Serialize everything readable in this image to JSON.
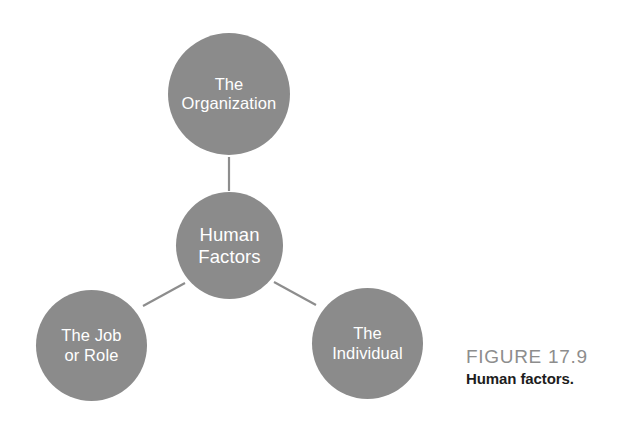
{
  "figure": {
    "caption_number": "FIGURE 17.9",
    "caption_title": "Human factors.",
    "background_color": "#ffffff"
  },
  "diagram": {
    "type": "node-link",
    "node_fill_color": "#8b8b8b",
    "node_text_color": "#ffffff",
    "connector_color": "#8d8d8d",
    "nodes": [
      {
        "id": "organization",
        "label": "The\nOrganization",
        "cx": 229,
        "cy": 94,
        "diameter": 122
      },
      {
        "id": "human-factors",
        "label": "Human\nFactors",
        "cx": 229,
        "cy": 245,
        "diameter": 107
      },
      {
        "id": "job-role",
        "label": "The Job\nor Role",
        "cx": 91,
        "cy": 345,
        "diameter": 111
      },
      {
        "id": "individual",
        "label": "The\nIndividual",
        "cx": 367,
        "cy": 343,
        "diameter": 111
      }
    ],
    "connectors": [
      {
        "id": "center-to-organization",
        "from": "human-factors",
        "to": "organization",
        "x1": 229,
        "y1": 191,
        "x2": 229,
        "y2": 157
      },
      {
        "id": "center-to-job-role",
        "from": "human-factors",
        "to": "job-role",
        "x1": 185,
        "y1": 283,
        "x2": 143,
        "y2": 306
      },
      {
        "id": "center-to-individual",
        "from": "human-factors",
        "to": "individual",
        "x1": 274,
        "y1": 282,
        "x2": 316,
        "y2": 305
      }
    ]
  }
}
